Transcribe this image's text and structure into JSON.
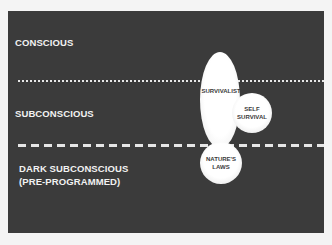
{
  "diagram": {
    "levels": [
      {
        "name": "conscious",
        "label": "CONSCIOUS"
      },
      {
        "name": "subconscious",
        "label": "SUBCONSCIOUS"
      },
      {
        "name": "dark-subconscious",
        "label_line1": "DARK SUBCONSCIOUS",
        "label_line2": "(PRE-PROGRAMMED)"
      }
    ],
    "dividers": [
      {
        "between": "conscious/subconscious",
        "style": "dotted"
      },
      {
        "between": "subconscious/dark-subconscious",
        "style": "dashed"
      }
    ],
    "shapes": {
      "survivalist": {
        "label": "SURVIVALIST",
        "shape": "ellipse"
      },
      "self_survival": {
        "line1": "SELF",
        "line2": "SURVIVAL",
        "shape": "circle"
      },
      "natures_laws": {
        "line1": "NATURE'S",
        "line2": "LAWS",
        "shape": "circle"
      }
    },
    "colors": {
      "background": "#3b3b3b",
      "text": "#f2f2f2",
      "shape_fill": "#ffffff",
      "shape_text": "#3a3a3a"
    }
  }
}
